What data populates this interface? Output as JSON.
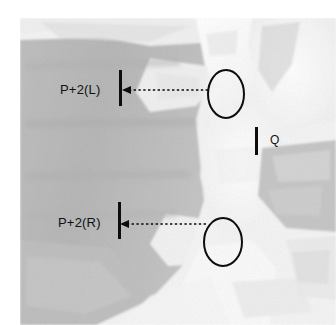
{
  "figure": {
    "kind": "radiograph-annotated",
    "width": 336,
    "height": 325,
    "modality_appearance": "grayscale-bone-and-soft-tissue",
    "background_color": "#ffffff",
    "soft_tissue_color": "#b7b7b7",
    "bone_color": "#fbfbfb",
    "annotation_color": "#0d0d0d"
  },
  "annotations": {
    "labels": [
      {
        "id": "p2l",
        "text": "P+2(L)",
        "x": 60,
        "y": 83
      },
      {
        "id": "p2r",
        "text": "P+2(R)",
        "x": 58,
        "y": 216
      },
      {
        "id": "q",
        "text": "Q",
        "x": 270,
        "y": 134
      }
    ],
    "tick_marks": [
      {
        "id": "tick-upper",
        "x": 119,
        "y": 70,
        "width": 3,
        "height": 36
      },
      {
        "id": "tick-lower",
        "x": 118,
        "y": 202,
        "width": 3,
        "height": 37
      },
      {
        "id": "tick-q",
        "x": 255,
        "y": 127,
        "width": 3,
        "height": 28
      }
    ],
    "ellipses": [
      {
        "id": "roi-upper",
        "cx": 226,
        "cy": 94,
        "rx": 18,
        "ry": 24
      },
      {
        "id": "roi-lower",
        "cx": 223,
        "cy": 242,
        "rx": 19,
        "ry": 24
      }
    ],
    "measure_arrows": [
      {
        "id": "arrow-upper",
        "from_x": 208,
        "to_x": 124,
        "y": 90,
        "head": "left"
      },
      {
        "id": "arrow-lower",
        "from_x": 206,
        "to_x": 122,
        "y": 224,
        "head": "left"
      }
    ]
  },
  "colors": {
    "annotation": "#0d0d0d",
    "soft_tissue": "#b7b7b7",
    "bone_bright": "#fbfbfb",
    "mid_gray": "#cfcfcf",
    "dark_gray": "#a8a8a8"
  }
}
